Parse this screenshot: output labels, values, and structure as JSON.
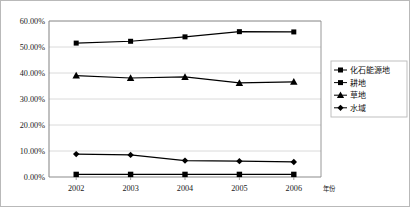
{
  "chart_data": {
    "type": "line",
    "title": "",
    "subtitle": "",
    "xlabel": "年份",
    "ylabel": "",
    "categories": [
      "2002",
      "2003",
      "2004",
      "2005",
      "2006"
    ],
    "x_tick_labels": [
      "2002",
      "2003",
      "2004",
      "2005",
      "2006"
    ],
    "y_tick_labels": [
      "0.00%",
      "10.00%",
      "20.00%",
      "30.00%",
      "40.00%",
      "50.00%",
      "60.00%"
    ],
    "y_tick_values": [
      0,
      10,
      20,
      30,
      40,
      50,
      60
    ],
    "ylim": [
      0,
      60
    ],
    "y_unit": "%",
    "grid": "horizontal",
    "legend_position": "right",
    "series": [
      {
        "name": "化石能源地",
        "marker": "square",
        "color": "#000000",
        "values": [
          51.5,
          52.2,
          53.9,
          55.9,
          55.8
        ]
      },
      {
        "name": "耕地",
        "marker": "square",
        "color": "#000000",
        "values": [
          1.0,
          1.0,
          1.0,
          1.0,
          1.0
        ]
      },
      {
        "name": "草地",
        "marker": "triangle",
        "color": "#000000",
        "values": [
          39.0,
          38.1,
          38.5,
          36.2,
          36.6
        ]
      },
      {
        "name": "水域",
        "marker": "diamond",
        "color": "#000000",
        "values": [
          8.8,
          8.5,
          6.3,
          6.1,
          5.8
        ]
      }
    ]
  },
  "legend": {
    "items": [
      {
        "label": "化石能源地",
        "marker": "square"
      },
      {
        "label": "耕地",
        "marker": "square"
      },
      {
        "label": "草地",
        "marker": "triangle"
      },
      {
        "label": "水域",
        "marker": "diamond"
      }
    ]
  },
  "colors": {
    "line": "#000000",
    "grid": "#d0d0d0",
    "axis": "#8c8c8c",
    "frame": "#b9b9b9",
    "text": "#1a1a1a"
  }
}
